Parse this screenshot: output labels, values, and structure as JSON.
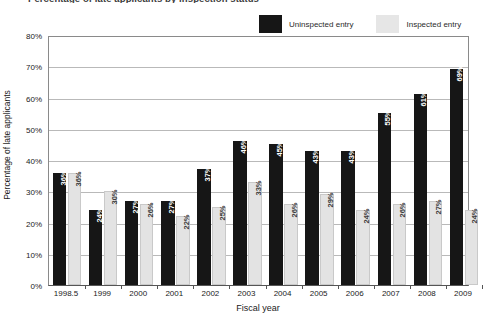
{
  "chart_data": {
    "type": "bar",
    "title": "Percentage of late applicants by inspection status",
    "xlabel": "Fiscal year",
    "ylabel": "Percentage of late applicants",
    "categories": [
      "1998.5",
      "1999",
      "2000",
      "2001",
      "2002",
      "2003",
      "2004",
      "2005",
      "2006",
      "2007",
      "2008",
      "2009"
    ],
    "series": [
      {
        "name": "Uninspected entry",
        "color": "#161616",
        "values": [
          36,
          24,
          27,
          27,
          37,
          46,
          45,
          43,
          43,
          55,
          61,
          69
        ],
        "labels": [
          "36%",
          "24%",
          "27%",
          "27%",
          "37%",
          "46%",
          "45%",
          "43%",
          "43%",
          "55%",
          "61%",
          "69%"
        ]
      },
      {
        "name": "Inspected entry",
        "color": "#e3e3e3",
        "values": [
          36,
          30,
          26,
          22,
          25,
          33,
          26,
          29,
          24,
          26,
          27,
          24
        ],
        "labels": [
          "36%",
          "30%",
          "26%",
          "22%",
          "25%",
          "33%",
          "26%",
          "29%",
          "24%",
          "26%",
          "27%",
          "24%"
        ]
      }
    ],
    "ylim": [
      0,
      80
    ],
    "ytick_values": [
      0,
      10,
      20,
      30,
      40,
      50,
      60,
      70,
      80
    ],
    "ytick_labels": [
      "0%",
      "10%",
      "20%",
      "30%",
      "40%",
      "50%",
      "60%",
      "70%",
      "80%"
    ],
    "grid": true,
    "legend_position": "top-right"
  }
}
